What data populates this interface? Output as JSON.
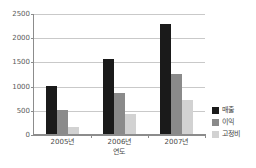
{
  "chart_data": {
    "type": "bar",
    "title": "",
    "subtitle": "",
    "xlabel": "연도",
    "ylabel": "",
    "categories": [
      "2005년",
      "2006년",
      "2007년"
    ],
    "series": [
      {
        "name": "매출",
        "color": "#1a1a1a",
        "values": [
          1000,
          1550,
          2280
        ]
      },
      {
        "name": "이익",
        "color": "#8a8a8a",
        "values": [
          500,
          850,
          1250
        ]
      },
      {
        "name": "고정비",
        "color": "#d2d2d2",
        "values": [
          150,
          420,
          700
        ]
      }
    ],
    "ylim": [
      0,
      2500
    ],
    "yticks": [
      0,
      500,
      1000,
      1500,
      2000,
      2500
    ],
    "ytick_labels": [
      "0",
      "500",
      "1000",
      "1500",
      "2000",
      "2500"
    ],
    "grid": true,
    "legend_position": "right"
  }
}
